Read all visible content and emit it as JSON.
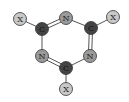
{
  "diagram": {
    "colors": {
      "carbon_fill": "#444444",
      "carbon_text": "#111111",
      "nitrogen_fill": "#9a9a9a",
      "substituent_fill": "#c8c8c8",
      "stroke": "#333333",
      "bond": "#555555"
    },
    "atoms": [
      {
        "id": "x1",
        "label": "X",
        "type": "substituent",
        "x": 20,
        "y": 19
      },
      {
        "id": "c1",
        "label": "C",
        "type": "carbon",
        "x": 42,
        "y": 29
      },
      {
        "id": "n1",
        "label": "N",
        "type": "nitrogen",
        "x": 66,
        "y": 18
      },
      {
        "id": "c2",
        "label": "C",
        "type": "carbon",
        "x": 91,
        "y": 28
      },
      {
        "id": "x2",
        "label": "X",
        "type": "substituent",
        "x": 113,
        "y": 17
      },
      {
        "id": "n2",
        "label": "N",
        "type": "nitrogen",
        "x": 90,
        "y": 56
      },
      {
        "id": "c3",
        "label": "C",
        "type": "carbon",
        "x": 66,
        "y": 68
      },
      {
        "id": "x3",
        "label": "X",
        "type": "substituent",
        "x": 66,
        "y": 89
      },
      {
        "id": "n3",
        "label": "N",
        "type": "nitrogen",
        "x": 42,
        "y": 56
      }
    ],
    "bonds": [
      {
        "from": "x1",
        "to": "c1",
        "order": 1
      },
      {
        "from": "c1",
        "to": "n1",
        "order": 2
      },
      {
        "from": "n1",
        "to": "c2",
        "order": 1
      },
      {
        "from": "c2",
        "to": "x2",
        "order": 1
      },
      {
        "from": "c2",
        "to": "n2",
        "order": 2
      },
      {
        "from": "n2",
        "to": "c3",
        "order": 1
      },
      {
        "from": "c3",
        "to": "x3",
        "order": 1
      },
      {
        "from": "c3",
        "to": "n3",
        "order": 2
      },
      {
        "from": "n3",
        "to": "c1",
        "order": 1
      }
    ]
  }
}
